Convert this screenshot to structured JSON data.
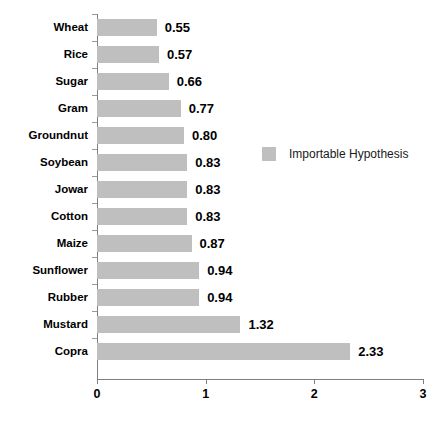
{
  "chart_data": {
    "type": "bar",
    "orientation": "horizontal",
    "title": "",
    "xlabel": "",
    "ylabel": "",
    "xlim": [
      0,
      3
    ],
    "xticks": [
      "0",
      "1",
      "2",
      "3"
    ],
    "grid": false,
    "legend_position": "center-right",
    "categories": [
      "Wheat",
      "Rice",
      "Sugar",
      "Gram",
      "Groundnut",
      "Soybean",
      "Jowar",
      "Cotton",
      "Maize",
      "Sunflower",
      "Rubber",
      "Mustard",
      "Copra"
    ],
    "values": [
      0.55,
      0.57,
      0.66,
      0.77,
      0.8,
      0.83,
      0.83,
      0.83,
      0.87,
      0.94,
      0.94,
      1.32,
      2.33
    ],
    "value_labels": [
      "0.55",
      "0.57",
      "0.66",
      "0.77",
      "0.80",
      "0.83",
      "0.83",
      "0.83",
      "0.87",
      "0.94",
      "0.94",
      "1.32",
      "2.33"
    ],
    "series": [
      {
        "name": "Importable Hypothesis",
        "color": "#bfbfbf",
        "values": [
          0.55,
          0.57,
          0.66,
          0.77,
          0.8,
          0.83,
          0.83,
          0.83,
          0.87,
          0.94,
          0.94,
          1.32,
          2.33
        ]
      }
    ]
  },
  "legend": {
    "entries": [
      {
        "label": "Importable Hypothesis",
        "color": "#bfbfbf"
      }
    ]
  },
  "colors": {
    "bar_fill": "#bfbfbf",
    "axis": "#7f7f7f",
    "text": "#000000",
    "background": "#ffffff"
  }
}
